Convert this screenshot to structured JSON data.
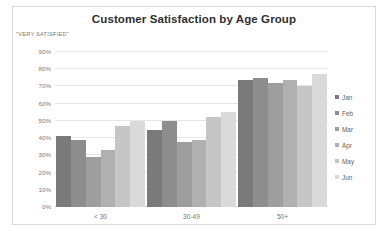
{
  "card": {
    "border_color": "#d9d9d9",
    "background": "#ffffff"
  },
  "chart_data": {
    "type": "bar",
    "title": "Customer Satisfaction by Age Group",
    "xlabel": "",
    "ylabel": "\"VERY SATISFIED\"",
    "categories": [
      "< 30",
      "30-49",
      "50+"
    ],
    "series": [
      {
        "name": "Jan",
        "color": "#7a7a7a",
        "values": [
          41,
          45,
          74
        ]
      },
      {
        "name": "Feb",
        "color": "#8d8d8d",
        "values": [
          39,
          50,
          75
        ]
      },
      {
        "name": "Mar",
        "color": "#9e9e9e",
        "values": [
          29,
          38,
          72
        ]
      },
      {
        "name": "Apr",
        "color": "#b0b0b0",
        "values": [
          33,
          39,
          74
        ]
      },
      {
        "name": "May",
        "color": "#c6c6c6",
        "values": [
          47,
          52,
          70
        ]
      },
      {
        "name": "Jun",
        "color": "#dadada",
        "values": [
          50,
          55,
          77
        ]
      }
    ],
    "ylim": [
      0,
      90
    ],
    "ytick_step": 10,
    "yticks": [
      "0%",
      "10%",
      "20%",
      "30%",
      "40%",
      "50%",
      "60%",
      "70%",
      "80%",
      "90%"
    ],
    "grid": true,
    "grid_color": "#e6e6e6",
    "legend_position": "right",
    "value_suffix": "%"
  }
}
